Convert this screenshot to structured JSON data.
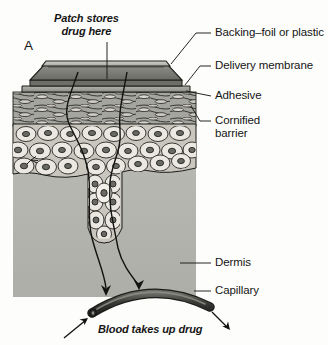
{
  "figure": {
    "panel_label": "A",
    "title_note": "Transdermal patch drug delivery through skin",
    "background_color": "#fdfdfb",
    "ink_color": "#151515"
  },
  "annotations": {
    "patch_store": "Patch stores\ndrug here",
    "patch_store_line1": "Patch stores",
    "patch_store_line2": "drug here",
    "blood_uptake": "Blood takes up drug"
  },
  "labels": [
    {
      "id": "backing",
      "text": "Backing–foil or plastic",
      "x": 214,
      "y": 32
    },
    {
      "id": "membrane",
      "text": "Delivery membrane",
      "x": 214,
      "y": 65
    },
    {
      "id": "adhesive",
      "text": "Adhesive",
      "x": 214,
      "y": 95
    },
    {
      "id": "cornified",
      "text": "Cornified\nbarrier",
      "x": 214,
      "y": 120
    },
    {
      "id": "dermis",
      "text": "Dermis",
      "x": 214,
      "y": 262
    },
    {
      "id": "capillary",
      "text": "Capillary",
      "x": 214,
      "y": 290
    }
  ],
  "label_lines": {
    "cornified_line1": "Cornified",
    "cornified_line2": "barrier"
  },
  "structures": [
    {
      "name": "patch-backing",
      "role": "foil or plastic outer film",
      "color": "#b9b9b4"
    },
    {
      "name": "patch-reservoir",
      "role": "drug reservoir",
      "color": "#7e7e7a"
    },
    {
      "name": "delivery-membrane",
      "role": "rate controlling membrane",
      "color": "#6e6e6a"
    },
    {
      "name": "adhesive-layer",
      "role": "skin adhesive flange",
      "color": "#a3a39e"
    },
    {
      "name": "cornified-barrier",
      "role": "stratum corneum",
      "color": "#9a9a95"
    },
    {
      "name": "epidermis",
      "role": "living cell layers",
      "color": "#dedbd4"
    },
    {
      "name": "dermis",
      "role": "connective tissue",
      "color": "#b6b6b1"
    },
    {
      "name": "capillary",
      "role": "blood vessel",
      "color": "#4a4a46"
    }
  ],
  "colors": {
    "dermis": "#b6b6b1",
    "epidermis_cell": "#e6e3dc",
    "cornified": "#9c9c97",
    "patch_dark": "#76766f",
    "patch_light": "#c2c2bc",
    "capillary": "#3f3f3b",
    "outline": "#1a1a18"
  }
}
